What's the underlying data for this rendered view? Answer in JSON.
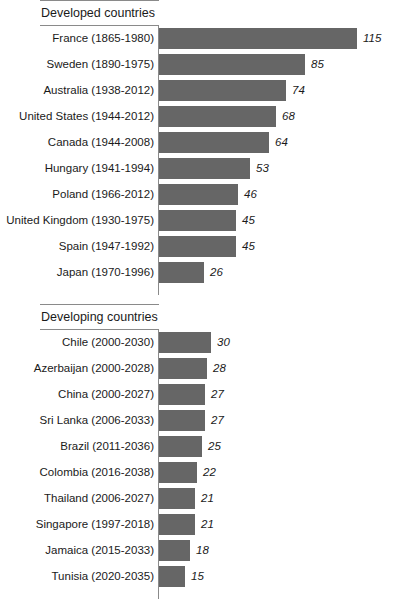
{
  "chart_data": {
    "type": "bar",
    "orientation": "horizontal",
    "title": "",
    "subtitle": "",
    "xlabel": "",
    "ylabel": "",
    "grid": false,
    "legend": null,
    "value_label_style": "italic",
    "xlim": [
      0,
      118
    ],
    "bar_color": "#666666",
    "axis_color": "#8a8a8a",
    "groups": [
      {
        "name": "Developed countries",
        "categories": [
          "France (1865-1980)",
          "Sweden (1890-1975)",
          "Australia (1938-2012)",
          "United States (1944-2012)",
          "Canada (1944-2008)",
          "Hungary (1941-1994)",
          "Poland (1966-2012)",
          "United Kingdom (1930-1975)",
          "Spain (1947-1992)",
          "Japan (1970-1996)"
        ],
        "values": [
          115,
          85,
          74,
          68,
          64,
          53,
          46,
          45,
          45,
          26
        ]
      },
      {
        "name": "Developing countries",
        "categories": [
          "Chile (2000-2030)",
          "Azerbaijan (2000-2028)",
          "China (2000-2027)",
          "Sri Lanka (2006-2033)",
          "Brazil (2011-2036)",
          "Colombia (2016-2038)",
          "Thailand (2006-2027)",
          "Singapore (1997-2018)",
          "Jamaica (2015-2033)",
          "Tunisia (2020-2035)"
        ],
        "values": [
          30,
          28,
          27,
          27,
          25,
          22,
          21,
          21,
          18,
          15
        ]
      }
    ]
  }
}
